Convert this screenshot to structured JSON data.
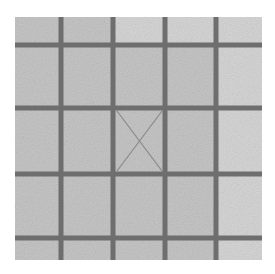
{
  "image": {
    "description": "Grayscale photo of a 5x5 grid of light gray tiles separated by dark gray grout lines; center tile has a faint X mark",
    "background": "#ffffff",
    "tile_color": "#c6c6c6",
    "tile_light_color": "#d6d6d6",
    "line_color": "#6e6e6e",
    "mark_color": "#8a8a8a",
    "grid": {
      "left": 15,
      "top": 17,
      "right": 262,
      "bottom": 260,
      "vertical_lines": [
        61,
        113,
        165,
        216
      ],
      "horizontal_lines": [
        45,
        108,
        174,
        238
      ],
      "line_width": 5,
      "rows": 5,
      "cols": 5
    },
    "center_mark": {
      "type": "X",
      "x1": 117,
      "y1": 111,
      "x2": 162,
      "y2": 171
    }
  }
}
